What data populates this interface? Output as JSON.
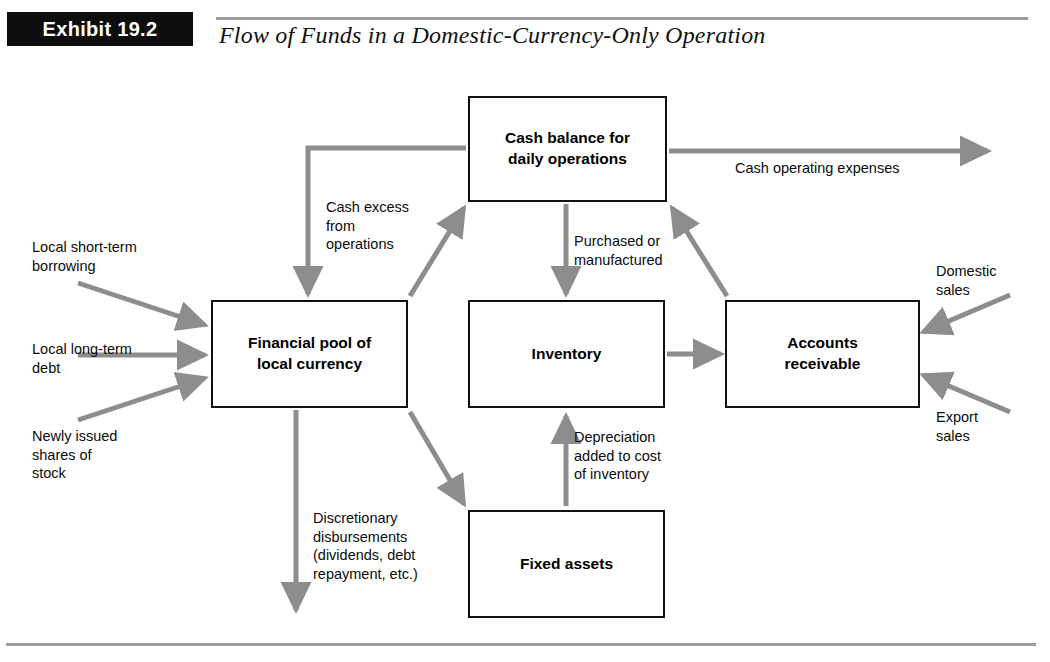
{
  "header": {
    "badge": "Exhibit 19.2",
    "title": "Flow of Funds in a Domestic-Currency-Only Operation"
  },
  "colors": {
    "arrow_gray": "#8d8d8d",
    "box_border": "#111111",
    "badge_background": "#0d0d0d",
    "badge_text": "#ffffff",
    "rule_gray": "#9a9a9a",
    "text": "#0b0b0b"
  },
  "diagram": {
    "type": "flowchart",
    "nodes": [
      {
        "id": "cash",
        "label_line1": "Cash balance for",
        "label_line2": "daily operations"
      },
      {
        "id": "pool",
        "label_line1": "Financial pool of",
        "label_line2": "local currency"
      },
      {
        "id": "inventory",
        "label_line1": "Inventory",
        "label_line2": ""
      },
      {
        "id": "ar",
        "label_line1": "Accounts",
        "label_line2": "receivable"
      },
      {
        "id": "fixed",
        "label_line1": "Fixed assets",
        "label_line2": ""
      }
    ],
    "edge_labels": {
      "local_short_term_borrowing": "Local short-term\nborrowing",
      "local_long_term_debt": "Local long-term\ndebt",
      "newly_issued_shares": "Newly issued\nshares of\nstock",
      "cash_excess_from_operations": "Cash excess\nfrom\noperations",
      "purchased_or_manufactured": "Purchased or\nmanufactured",
      "depreciation_added": "Depreciation\nadded to cost\nof inventory",
      "discretionary_disbursements": "Discretionary\ndisbursements\n(dividends, debt\nrepayment, etc.)",
      "cash_operating_expenses": "Cash operating expenses",
      "domestic_sales": "Domestic\nsales",
      "export_sales": "Export\nsales"
    },
    "edges": [
      {
        "from": "local short-term borrowing",
        "to": "pool",
        "label": "Local short-term borrowing"
      },
      {
        "from": "local long-term debt",
        "to": "pool",
        "label": "Local long-term debt"
      },
      {
        "from": "newly issued shares of stock",
        "to": "pool",
        "label": "Newly issued shares of stock"
      },
      {
        "from": "cash",
        "to": "pool",
        "label": "Cash excess from operations"
      },
      {
        "from": "pool",
        "to": "cash",
        "label": ""
      },
      {
        "from": "cash",
        "to": "inventory",
        "label": "Purchased or manufactured"
      },
      {
        "from": "cash",
        "to": "outside",
        "label": "Cash operating expenses"
      },
      {
        "from": "inventory",
        "to": "ar",
        "label": ""
      },
      {
        "from": "ar",
        "to": "cash",
        "label": ""
      },
      {
        "from": "fixed",
        "to": "inventory",
        "label": "Depreciation added to cost of inventory"
      },
      {
        "from": "pool",
        "to": "fixed",
        "label": ""
      },
      {
        "from": "pool",
        "to": "outside",
        "label": "Discretionary disbursements (dividends, debt repayment, etc.)"
      },
      {
        "from": "domestic sales",
        "to": "ar",
        "label": "Domestic sales"
      },
      {
        "from": "export sales",
        "to": "ar",
        "label": "Export sales"
      }
    ]
  }
}
